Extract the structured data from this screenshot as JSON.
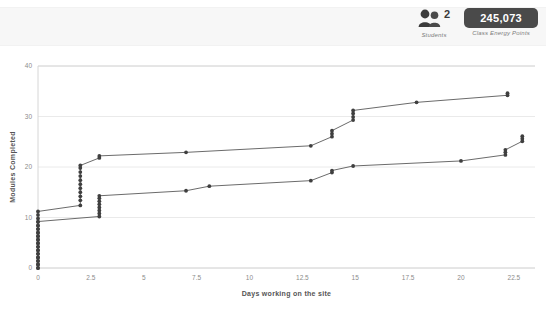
{
  "header": {
    "students": {
      "icon": "people-icon",
      "count": "2",
      "caption": "Students"
    },
    "energy": {
      "value": "245,073",
      "caption": "Class Energy Points"
    }
  },
  "chart_data": {
    "type": "line",
    "title": "",
    "xlabel": "Days working on the site",
    "ylabel": "Modules Completed",
    "xlim": [
      0,
      23.5
    ],
    "ylim": [
      0,
      40
    ],
    "xticks": [
      0,
      2.5,
      5,
      7.5,
      10,
      12.5,
      15,
      17.5,
      20,
      22.5
    ],
    "xtick_labels": [
      "0",
      "2.5",
      "5",
      "7.5",
      "10",
      "12.5",
      "15",
      "17.5",
      "20",
      "22.5"
    ],
    "yticks": [
      0,
      10,
      20,
      30,
      40
    ],
    "ytick_labels": [
      "0",
      "10",
      "20",
      "30",
      "40"
    ],
    "grid": "horizontal",
    "legend": "none",
    "line_color": "#6b6b6b",
    "marker_color": "#3f3f3f",
    "series": [
      {
        "name": "Student 1",
        "points": [
          [
            0.0,
            0.0
          ],
          [
            0.0,
            0.7
          ],
          [
            0.0,
            1.4
          ],
          [
            0.0,
            2.1
          ],
          [
            0.0,
            2.8
          ],
          [
            0.0,
            3.5
          ],
          [
            0.0,
            4.2
          ],
          [
            0.0,
            4.9
          ],
          [
            0.0,
            5.6
          ],
          [
            0.0,
            6.3
          ],
          [
            0.0,
            7.0
          ],
          [
            0.0,
            7.7
          ],
          [
            0.0,
            8.4
          ],
          [
            0.0,
            9.1
          ],
          [
            0.0,
            9.8
          ],
          [
            0.0,
            10.5
          ],
          [
            0.0,
            11.2
          ],
          [
            2.0,
            12.4
          ],
          [
            2.0,
            13.4
          ],
          [
            2.0,
            14.2
          ],
          [
            2.0,
            15.0
          ],
          [
            2.0,
            15.8
          ],
          [
            2.0,
            16.6
          ],
          [
            2.0,
            17.4
          ],
          [
            2.0,
            18.2
          ],
          [
            2.0,
            19.0
          ],
          [
            2.0,
            19.8
          ],
          [
            2.0,
            20.3
          ],
          [
            2.9,
            21.8
          ],
          [
            2.9,
            22.2
          ],
          [
            7.0,
            22.9
          ],
          [
            12.9,
            24.2
          ],
          [
            13.9,
            26.0
          ],
          [
            13.9,
            26.6
          ],
          [
            13.9,
            27.2
          ],
          [
            14.9,
            29.3
          ],
          [
            14.9,
            29.9
          ],
          [
            14.9,
            30.6
          ],
          [
            14.9,
            31.2
          ],
          [
            17.9,
            32.8
          ],
          [
            22.2,
            34.2
          ],
          [
            22.2,
            34.6
          ]
        ]
      },
      {
        "name": "Student 2",
        "points": [
          [
            0.0,
            0.0
          ],
          [
            0.0,
            0.7
          ],
          [
            0.0,
            1.4
          ],
          [
            0.0,
            2.1
          ],
          [
            0.0,
            2.8
          ],
          [
            0.0,
            3.5
          ],
          [
            0.0,
            4.2
          ],
          [
            0.0,
            4.9
          ],
          [
            0.0,
            5.6
          ],
          [
            0.0,
            6.3
          ],
          [
            0.0,
            7.0
          ],
          [
            0.0,
            7.7
          ],
          [
            0.0,
            8.4
          ],
          [
            0.0,
            9.2
          ],
          [
            2.9,
            10.2
          ],
          [
            2.9,
            10.8
          ],
          [
            2.9,
            11.4
          ],
          [
            2.9,
            12.0
          ],
          [
            2.9,
            12.6
          ],
          [
            2.9,
            13.2
          ],
          [
            2.9,
            13.8
          ],
          [
            2.9,
            14.3
          ],
          [
            7.0,
            15.3
          ],
          [
            8.1,
            16.2
          ],
          [
            12.9,
            17.3
          ],
          [
            13.9,
            18.9
          ],
          [
            13.9,
            19.3
          ],
          [
            14.9,
            20.2
          ],
          [
            20.0,
            21.2
          ],
          [
            22.1,
            22.4
          ],
          [
            22.1,
            22.9
          ],
          [
            22.1,
            23.4
          ],
          [
            22.9,
            25.1
          ],
          [
            22.9,
            25.6
          ],
          [
            22.9,
            26.1
          ]
        ]
      }
    ]
  }
}
